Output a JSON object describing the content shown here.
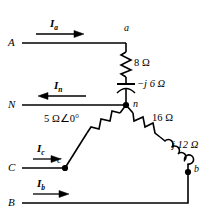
{
  "diagram": {
    "line_color": "#000000",
    "background": "#ffffff",
    "terminals": [
      {
        "id": "A",
        "label": "A"
      },
      {
        "id": "N",
        "label": "N"
      },
      {
        "id": "C",
        "label": "C"
      },
      {
        "id": "B",
        "label": "B"
      }
    ],
    "nodes": [
      {
        "id": "a",
        "label": "a"
      },
      {
        "id": "n",
        "label": "n"
      },
      {
        "id": "c",
        "label": "c"
      },
      {
        "id": "b",
        "label": "b"
      }
    ],
    "currents": [
      {
        "id": "Ia",
        "symbol": "I",
        "subscript": "a",
        "direction": "right"
      },
      {
        "id": "In",
        "symbol": "I",
        "subscript": "n",
        "direction": "left"
      },
      {
        "id": "Ic",
        "symbol": "I",
        "subscript": "c",
        "direction": "right"
      },
      {
        "id": "Ib",
        "symbol": "I",
        "subscript": "b",
        "direction": "right"
      }
    ],
    "impedances": [
      {
        "id": "R8",
        "label": "8 Ω",
        "element": "resistor",
        "branch": "a-n"
      },
      {
        "id": "Xc6",
        "label": "−j 6 Ω",
        "element": "capacitor",
        "branch": "a-n"
      },
      {
        "id": "Z5",
        "label": "5 Ω∠0°",
        "element": "resistor",
        "branch": "c-n"
      },
      {
        "id": "R16",
        "label": "16 Ω",
        "element": "resistor",
        "branch": "b-n"
      },
      {
        "id": "Xl12",
        "label": "j 12 Ω",
        "element": "inductor",
        "branch": "b-n"
      }
    ]
  }
}
